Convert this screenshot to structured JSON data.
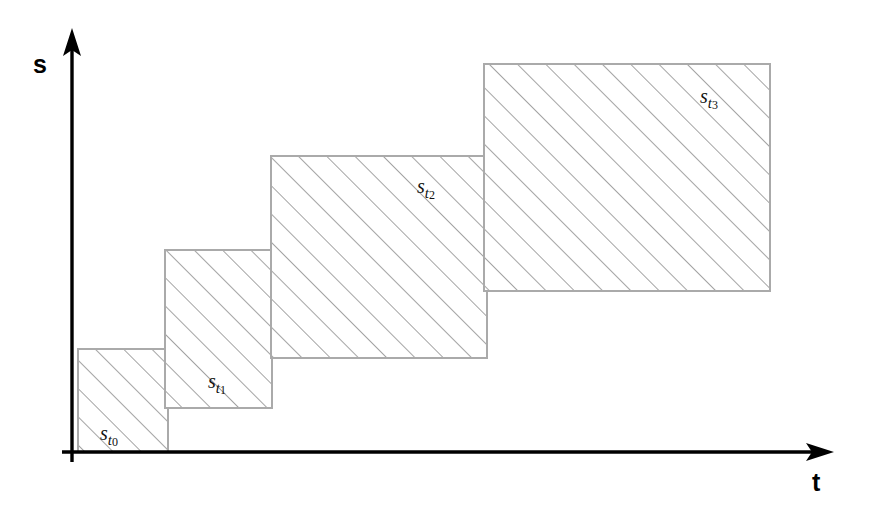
{
  "figure": {
    "background_color": "#ffffff",
    "width": 876,
    "height": 522
  },
  "axes": {
    "vertical": {
      "label": "s",
      "color": "#000000",
      "x": 72,
      "y_top": 30,
      "y_bottom": 462,
      "arrow": "up-arrow-icon"
    },
    "horizontal": {
      "label": "t",
      "color": "#000000",
      "y": 452,
      "x_left": 62,
      "x_right": 832,
      "arrow": "right-arrow-icon"
    }
  },
  "style": {
    "block_fill": "#ffffff",
    "block_border_color": "#aaaaaa",
    "block_border_width": 2,
    "hatch_color": "#8d8d8d",
    "hatch_angle_deg": 45,
    "hatch_spacing": 20,
    "hatch_width": 1.6
  },
  "chart_data": {
    "type": "bar",
    "title": "",
    "xlabel": "t",
    "ylabel": "s",
    "grid": false,
    "legend": null,
    "axis_arrows": true,
    "categories": [
      "s_t0",
      "s_t1",
      "s_t2",
      "s_t3"
    ],
    "labels": [
      "st0",
      "st1",
      "st2",
      "st3"
    ],
    "values": [
      103,
      158,
      202,
      227
    ],
    "blocks": [
      {
        "id": "block-st0",
        "label_base": "s",
        "label_sub_var": "t",
        "label_sub_idx": "0",
        "x": 78,
        "y": 349,
        "width": 90,
        "height": 103,
        "label_x": 100,
        "label_y": 423
      },
      {
        "id": "block-st1",
        "label_base": "s",
        "label_sub_var": "t",
        "label_sub_idx": "1",
        "x": 165,
        "y": 250,
        "width": 107,
        "height": 158,
        "label_x": 208,
        "label_y": 371
      },
      {
        "id": "block-st2",
        "label_base": "s",
        "label_sub_var": "t",
        "label_sub_idx": "2",
        "x": 271,
        "y": 156,
        "width": 216,
        "height": 202,
        "label_x": 417,
        "label_y": 176
      },
      {
        "id": "block-st3",
        "label_base": "s",
        "label_sub_var": "t",
        "label_sub_idx": "3",
        "x": 484,
        "y": 64,
        "width": 286,
        "height": 227,
        "label_x": 700,
        "label_y": 86
      }
    ]
  }
}
